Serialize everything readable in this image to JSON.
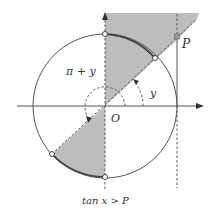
{
  "diagram": {
    "type": "unit-circle-tangent-inequality",
    "labels": {
      "origin": "O",
      "point": "P",
      "angle_small": "y",
      "angle_large": "π + y",
      "caption": "tan x > P"
    },
    "colors": {
      "shade": "#bdbdbd",
      "line": "#555555",
      "dashed": "#555555",
      "background": "#ffffff"
    }
  }
}
